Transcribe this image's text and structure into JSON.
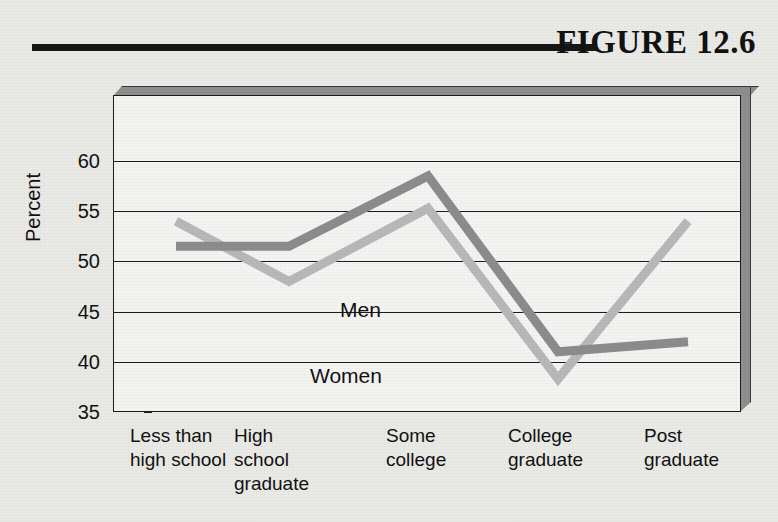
{
  "figure": {
    "title": "FIGURE 12.6"
  },
  "chart_data": {
    "type": "line",
    "title": "FIGURE 12.6",
    "xlabel": "",
    "ylabel": "Percent",
    "ylim": [
      35,
      60
    ],
    "yticks": [
      35,
      40,
      45,
      50,
      55,
      60
    ],
    "ytick_labels": [
      "35",
      "40",
      "45",
      "50",
      "55",
      "60"
    ],
    "grid": true,
    "legend_position": "inline-annotation",
    "categories": [
      "Less than\nhigh school",
      "High\nschool\ngraduate",
      "Some\ncollege",
      "College\ngraduate",
      "Post\ngraduate"
    ],
    "series": [
      {
        "name": "Men",
        "color": "#8c8c8c",
        "values": [
          51.5,
          51.5,
          58.5,
          41.0,
          42.0
        ]
      },
      {
        "name": "Women",
        "color": "#b8b8b8",
        "values": [
          54.0,
          48.0,
          55.3,
          38.3,
          54.0
        ]
      }
    ],
    "annotations": [
      {
        "text": "Men",
        "series": "Men"
      },
      {
        "text": "Women",
        "series": "Women"
      }
    ]
  },
  "colors": {
    "page_background": "#e9e9e6",
    "plot_background": "#f3f3f1",
    "axis": "#1c1c1c",
    "bevel": "#8e8e8e",
    "rule": "#161616",
    "men_line": "#8c8c8c",
    "women_line": "#b8b8b8"
  }
}
